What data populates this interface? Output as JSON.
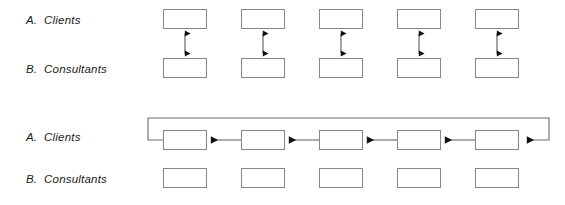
{
  "diagram": {
    "title": "",
    "panels": [
      {
        "id": "panel-top",
        "rows": [
          {
            "id": "row-clients-top",
            "label": "A.  Clients",
            "label_x": 26,
            "label_y": 14,
            "box_y": 9
          },
          {
            "id": "row-consultants-top",
            "label": "B.  Consultants",
            "label_x": 26,
            "label_y": 63,
            "box_y": 58
          }
        ],
        "connector_type": "bidirectional-vertical",
        "connector_count": 5
      },
      {
        "id": "panel-bottom",
        "rows": [
          {
            "id": "row-clients-bottom",
            "label": "A.  Clients",
            "label_x": 26,
            "label_y": 131,
            "box_y": 130
          },
          {
            "id": "row-consultants-bottom",
            "label": "B.  Consultants",
            "label_x": 26,
            "label_y": 173,
            "box_y": 168
          }
        ],
        "connector_type": "leftward-chain-with-feedback-loop",
        "connector_count": 4
      }
    ],
    "box_geometry": {
      "width": 44,
      "height": 20,
      "first_x": 163,
      "pitch": 78,
      "count": 5
    },
    "feedback_loop": {
      "top_y": 118,
      "left_x": 148,
      "right_x": 549
    },
    "colors": {
      "box_border": "#878787",
      "box_fill": "#ffffff",
      "connector": "#4d4d4d",
      "arrowhead": "#111111",
      "text": "#1a1a1a",
      "background": "#ffffff"
    }
  }
}
